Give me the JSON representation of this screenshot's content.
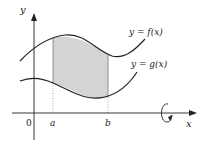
{
  "diagram": {
    "type": "volume-of-revolution",
    "labels": {
      "y_axis": "y",
      "x_axis": "x",
      "origin": "0",
      "a": "a",
      "b": "b",
      "f_curve": "y = f(x)",
      "g_curve": "y = g(x)"
    },
    "colors": {
      "stroke": "#222222",
      "shade": "#d4d4d4",
      "guide": "#888888"
    },
    "rotation_axis": "x"
  }
}
